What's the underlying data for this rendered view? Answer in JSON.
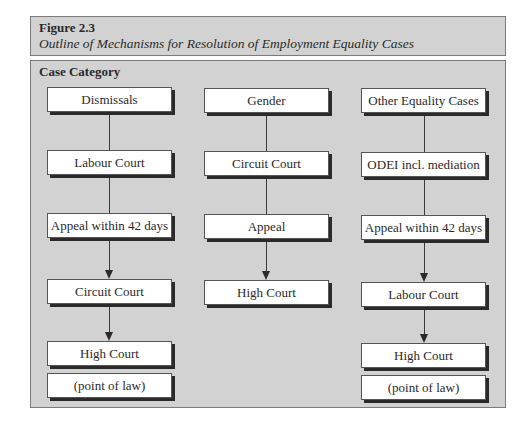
{
  "figure": {
    "number": "Figure 2.3",
    "title": "Outline of Mechanisms for Resolution of Employment Equality Cases"
  },
  "panel": {
    "header": "Case Category"
  },
  "columns": [
    {
      "name": "dismissals",
      "boxes": [
        "Dismissals",
        "Labour Court",
        "Appeal within 42 days",
        "Circuit Court",
        "High Court",
        "(point of law)"
      ]
    },
    {
      "name": "gender",
      "boxes": [
        "Gender",
        "Circuit Court",
        "Appeal",
        "High Court"
      ]
    },
    {
      "name": "other-equality",
      "boxes": [
        "Other Equality Cases",
        "ODEI incl. mediation",
        "Appeal within 42 days",
        "Labour Court",
        "High Court",
        "(point of law)"
      ]
    }
  ]
}
